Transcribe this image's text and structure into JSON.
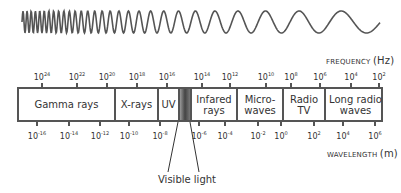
{
  "frequency_axis": {
    "title": "FREQUENCY",
    "unit": "(Hz)",
    "ticks": [
      {
        "base": "10",
        "exp": "24",
        "x": 42
      },
      {
        "base": "10",
        "exp": "22",
        "x": 77
      },
      {
        "base": "10",
        "exp": "20",
        "x": 107
      },
      {
        "base": "10",
        "exp": "18",
        "x": 137
      },
      {
        "base": "10",
        "exp": "16",
        "x": 167
      },
      {
        "base": "10",
        "exp": "14",
        "x": 202
      },
      {
        "base": "10",
        "exp": "12",
        "x": 230
      },
      {
        "base": "10",
        "exp": "10",
        "x": 266
      },
      {
        "base": "10",
        "exp": "8",
        "x": 291
      },
      {
        "base": "10",
        "exp": "6",
        "x": 320
      },
      {
        "base": "10",
        "exp": "4",
        "x": 351
      },
      {
        "base": "10",
        "exp": "2",
        "x": 379
      }
    ]
  },
  "wavelength_axis": {
    "title": "WAVELENGTH",
    "unit": "(m)",
    "ticks": [
      {
        "base": "10",
        "exp": "-16",
        "x": 37
      },
      {
        "base": "10",
        "exp": "-14",
        "x": 69
      },
      {
        "base": "10",
        "exp": "-12",
        "x": 100
      },
      {
        "base": "10",
        "exp": "-10",
        "x": 129
      },
      {
        "base": "10",
        "exp": "-8",
        "x": 160
      },
      {
        "base": "10",
        "exp": "-6",
        "x": 199
      },
      {
        "base": "10",
        "exp": "-4",
        "x": 225
      },
      {
        "base": "10",
        "exp": "-2",
        "x": 258
      },
      {
        "base": "10",
        "exp": "0",
        "x": 281
      },
      {
        "base": "10",
        "exp": "2",
        "x": 314
      },
      {
        "base": "10",
        "exp": "4",
        "x": 343
      },
      {
        "base": "10",
        "exp": "6",
        "x": 375
      }
    ]
  },
  "bands": [
    {
      "label": "Gamma rays",
      "left": 0,
      "width": 97
    },
    {
      "label": "X-rays",
      "left": 97,
      "width": 43
    },
    {
      "label": "UV",
      "left": 140,
      "width": 21
    },
    {
      "label": "Infared rays",
      "left": 173,
      "width": 46
    },
    {
      "label": "Micro-waves",
      "left": 219,
      "width": 46
    },
    {
      "label": "Radio TV",
      "left": 265,
      "width": 42
    },
    {
      "label": "Long radio waves",
      "left": 307,
      "width": 59
    }
  ],
  "visible_band": {
    "left": 161,
    "width": 12
  },
  "visible_label": "Visible light"
}
